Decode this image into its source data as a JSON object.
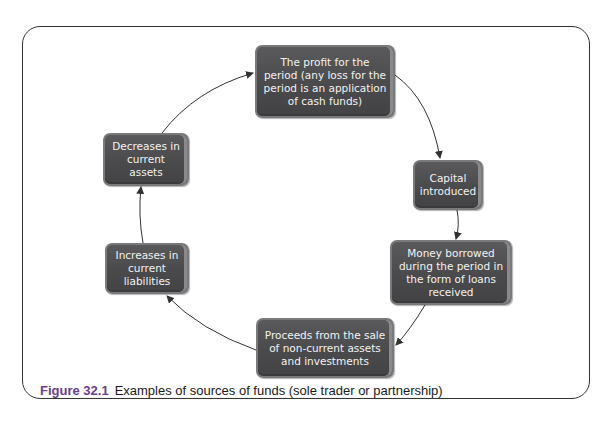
{
  "figure": {
    "label": "Figure 32.1",
    "caption": "Examples of sources of funds (sole trader or partnership)"
  },
  "nodes": [
    {
      "id": "profit",
      "text": "The profit for the period (any loss for the period is an application of cash funds)"
    },
    {
      "id": "capital",
      "text": "Capital introduced"
    },
    {
      "id": "borrowed",
      "text": "Money borrowed during the period in the form of loans received"
    },
    {
      "id": "proceeds",
      "text": "Proceeds from the sale of non-current assets and investments"
    },
    {
      "id": "liabilities",
      "text": "Increases in current liabilities"
    },
    {
      "id": "assets",
      "text": "Decreases in current assets"
    }
  ],
  "colors": {
    "node_fill": "#4a4a4c",
    "node_text": "#f2f2f2",
    "caption_label": "#6b3d8e",
    "arrow": "#333333"
  }
}
